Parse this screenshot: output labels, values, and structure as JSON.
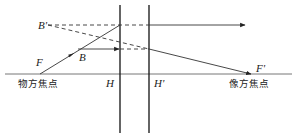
{
  "diagram": {
    "type": "optics-principal-planes",
    "colors": {
      "line": "#333333",
      "axis": "#555555",
      "plane": "#111111",
      "background": "#ffffff"
    },
    "labels": {
      "B_prime": "B'",
      "B": "B",
      "F": "F",
      "F_prime": "F'",
      "H": "H",
      "H_prime": "H'",
      "object_focus": "物方焦点",
      "image_focus": "像方焦点"
    },
    "elements": {
      "optical_axis": {
        "x1": 5,
        "y": 74,
        "x2": 292
      },
      "principal_plane_H": {
        "x": 120,
        "y1": 5,
        "y2": 133
      },
      "principal_plane_H_prime": {
        "x": 149,
        "y1": 5,
        "y2": 133
      },
      "points": {
        "F": [
          40,
          74
        ],
        "F_prime": [
          251,
          74
        ],
        "B": [
          78,
          49
        ],
        "B_prime": [
          48,
          25
        ]
      },
      "rays": [
        {
          "from": "F",
          "to": [
            120,
            25
          ],
          "style": "solid",
          "arrow_mid": true
        },
        {
          "from": [
            120,
            25
          ],
          "to": [
            245,
            25
          ],
          "style": "solid",
          "arrow_end": true,
          "note": "emerges parallel from H'"
        },
        {
          "from": "B_prime",
          "to": [
            149,
            25
          ],
          "style": "dashed"
        },
        {
          "from": "B",
          "to": [
            120,
            49
          ],
          "style": "solid",
          "arrow_end": true
        },
        {
          "from": [
            120,
            49
          ],
          "to": [
            149,
            49
          ],
          "style": "dashed"
        },
        {
          "from": "B_prime",
          "to": [
            149,
            49
          ],
          "style": "dashed"
        },
        {
          "from": [
            149,
            49
          ],
          "to": "F_prime",
          "style": "solid",
          "arrow_end": true
        }
      ]
    }
  }
}
